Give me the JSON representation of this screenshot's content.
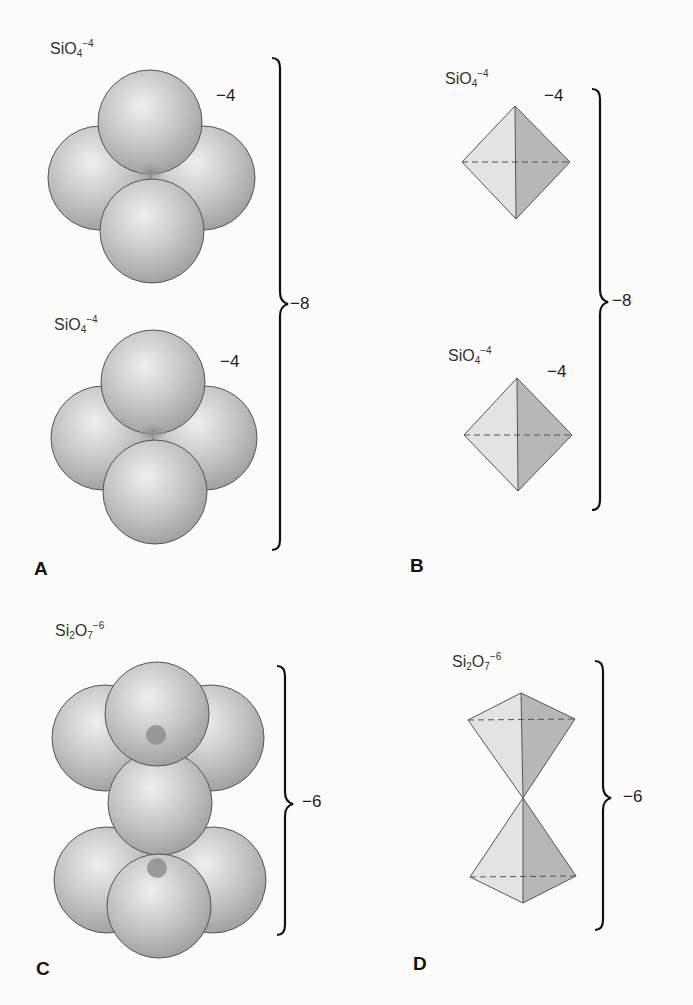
{
  "figure": {
    "colors": {
      "background": "#fbfbfa",
      "sphere_light": "#ededed",
      "sphere_dark": "#9a9a9a",
      "silicon": "#8f8f8f",
      "face_light": "#e2e2e2",
      "face_dark": "#b5b5b5",
      "outline": "#555555"
    },
    "panels": [
      {
        "letter": "A",
        "kind": "space-filling spheres",
        "groups": [
          {
            "formula_base": "SiO",
            "formula_sub": "4",
            "formula_sup": "−4",
            "charge": "−4"
          },
          {
            "formula_base": "SiO",
            "formula_sub": "4",
            "formula_sup": "−4",
            "charge": "−4"
          }
        ],
        "total_charge": "−8"
      },
      {
        "letter": "B",
        "kind": "tetrahedra",
        "groups": [
          {
            "formula_base": "SiO",
            "formula_sub": "4",
            "formula_sup": "−4",
            "charge": "−4"
          },
          {
            "formula_base": "SiO",
            "formula_sub": "4",
            "formula_sup": "−4",
            "charge": "−4"
          }
        ],
        "total_charge": "−8"
      },
      {
        "letter": "C",
        "kind": "space-filling spheres",
        "groups": [
          {
            "formula_si": "Si",
            "formula_si_sub": "2",
            "formula_o": "O",
            "formula_o_sub": "7",
            "formula_sup": "−6"
          }
        ],
        "total_charge": "−6"
      },
      {
        "letter": "D",
        "kind": "tetrahedra",
        "groups": [
          {
            "formula_si": "Si",
            "formula_si_sub": "2",
            "formula_o": "O",
            "formula_o_sub": "7",
            "formula_sup": "−6"
          }
        ],
        "total_charge": "−6"
      }
    ]
  }
}
